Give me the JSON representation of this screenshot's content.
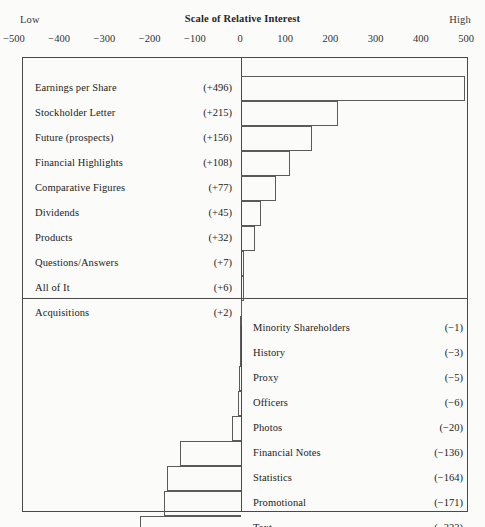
{
  "header": {
    "low_label": "Low",
    "high_label": "High",
    "scale_title": "Scale of Relative Interest"
  },
  "chart_data": {
    "type": "bar",
    "orientation": "horizontal",
    "title": "Scale of Relative Interest",
    "xlabel": "Scale of Relative Interest",
    "ylabel": "",
    "xlim": [
      -500,
      500
    ],
    "grid": false,
    "legend": null,
    "axis_end_labels": {
      "left": "Low",
      "right": "High"
    },
    "tick_labels": [
      "-500",
      "-400",
      "-300",
      "-200",
      "-100",
      "0",
      "100",
      "200",
      "300",
      "400",
      "500"
    ],
    "ticks": [
      -500,
      -400,
      -300,
      -200,
      -100,
      0,
      100,
      200,
      300,
      400,
      500
    ],
    "categories": [
      "Earnings per Share",
      "Stockholder Letter",
      "Future (prospects)",
      "Financial Highlights",
      "Comparative Figures",
      "Dividends",
      "Products",
      "Questions/Answers",
      "All of It",
      "Acquisitions",
      "Minority Shareholders",
      "History",
      "Proxy",
      "Officers",
      "Photos",
      "Financial Notes",
      "Statistics",
      "Promotional",
      "Text"
    ],
    "values": [
      496,
      215,
      156,
      108,
      77,
      45,
      32,
      7,
      6,
      2,
      -1,
      -3,
      -5,
      -6,
      -20,
      -136,
      -164,
      -171,
      -223
    ],
    "value_labels": [
      "(+496)",
      "(+215)",
      "(+156)",
      "(+108)",
      "(+77)",
      "(+45)",
      "(+32)",
      "(+7)",
      "(+6)",
      "(+2)",
      "(-1)",
      "(-3)",
      "(-5)",
      "(-6)",
      "(-20)",
      "(-136)",
      "(-164)",
      "(-171)",
      "(-223)"
    ]
  },
  "positive_rows": [
    {
      "label": "Earnings per Share",
      "value": "(+496)",
      "n": 496
    },
    {
      "label": "Stockholder Letter",
      "value": "(+215)",
      "n": 215
    },
    {
      "label": "Future (prospects)",
      "value": "(+156)",
      "n": 156
    },
    {
      "label": "Financial Highlights",
      "value": "(+108)",
      "n": 108
    },
    {
      "label": "Comparative Figures",
      "value": "(+77)",
      "n": 77
    },
    {
      "label": "Dividends",
      "value": "(+45)",
      "n": 45
    },
    {
      "label": "Products",
      "value": "(+32)",
      "n": 32
    },
    {
      "label": "Questions/Answers",
      "value": "(+7)",
      "n": 7
    },
    {
      "label": "All of It",
      "value": "(+6)",
      "n": 6
    },
    {
      "label": "Acquisitions",
      "value": "(+2)",
      "n": 2
    }
  ],
  "negative_rows": [
    {
      "label": "Minority Shareholders",
      "value": "(-1)",
      "n": -1
    },
    {
      "label": "History",
      "value": "(-3)",
      "n": -3
    },
    {
      "label": "Proxy",
      "value": "(-5)",
      "n": -5
    },
    {
      "label": "Officers",
      "value": "(-6)",
      "n": -6
    },
    {
      "label": "Photos",
      "value": "(-20)",
      "n": -20
    },
    {
      "label": "Financial Notes",
      "value": "(-136)",
      "n": -136
    },
    {
      "label": "Statistics",
      "value": "(-164)",
      "n": -164
    },
    {
      "label": "Promotional",
      "value": "(-171)",
      "n": -171
    },
    {
      "label": "Text",
      "value": "(-223)",
      "n": -223
    }
  ],
  "colors": {
    "background": "#fbfbf9",
    "ink": "#232323",
    "rule": "#4a4a4a",
    "bar_outline": "#5a5a5a"
  }
}
